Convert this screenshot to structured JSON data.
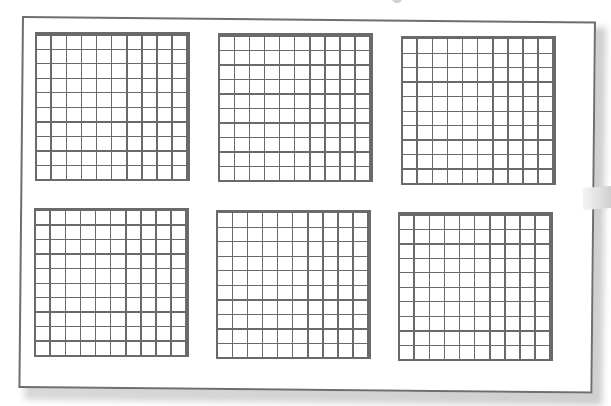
{
  "figure": {
    "layout": {
      "rows": 2,
      "columns": 3
    },
    "grids": [
      {
        "position": "top-left",
        "rows": 10,
        "columns": 10
      },
      {
        "position": "top-middle",
        "rows": 10,
        "columns": 10
      },
      {
        "position": "top-right",
        "rows": 10,
        "columns": 10
      },
      {
        "position": "bottom-left",
        "rows": 10,
        "columns": 10
      },
      {
        "position": "bottom-middle",
        "rows": 10,
        "columns": 10
      },
      {
        "position": "bottom-right",
        "rows": 10,
        "columns": 10
      }
    ],
    "colors": {
      "grid_line": "#6a6a6a",
      "frame_border": "#6e6e6e",
      "background": "#ffffff",
      "shadow": "#d0d0d0"
    }
  }
}
